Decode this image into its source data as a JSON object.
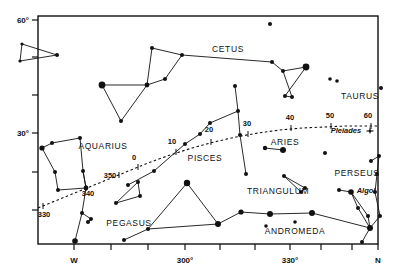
{
  "chart_data": {
    "type": "scatter",
    "title": "",
    "subtitle": "",
    "xlabel": "",
    "ylabel": "",
    "grid": false,
    "legend": null,
    "xlim": [
      262,
      372
    ],
    "ylim": [
      18,
      62
    ],
    "frame": {
      "left": 38,
      "right": 378,
      "top": 16,
      "bottom": 244
    },
    "x_axis": {
      "name": "azimuth",
      "ticks": [
        {
          "value": 270,
          "label": "W",
          "px": 74
        },
        {
          "value": 280,
          "label": "",
          "px": 111
        },
        {
          "value": 290,
          "label": "",
          "px": 148
        },
        {
          "value": 300,
          "label": "300°",
          "px": 185
        },
        {
          "value": 310,
          "label": "",
          "px": 220
        },
        {
          "value": 320,
          "label": "",
          "px": 255
        },
        {
          "value": 330,
          "label": "330°",
          "px": 290
        },
        {
          "value": 340,
          "label": "",
          "px": 321
        },
        {
          "value": 350,
          "label": "",
          "px": 352
        },
        {
          "value": 360,
          "label": "N",
          "px": 378
        }
      ]
    },
    "y_axis": {
      "name": "altitude",
      "ticks": [
        {
          "value": 60,
          "label": "60°",
          "px": 20
        },
        {
          "value": 50,
          "label": "",
          "px": 57
        },
        {
          "value": 40,
          "label": "",
          "px": 95
        },
        {
          "value": 30,
          "label": "30°",
          "px": 133
        },
        {
          "value": 20,
          "label": "",
          "px": 172
        },
        {
          "value": 10,
          "label": "",
          "px": 210
        }
      ]
    },
    "ecliptic": {
      "style": "dashed",
      "path": "M 38,208 L 60,199 L 82,190 L 104,181 L 126,172 L 148,163 L 170,155 L 192,148 L 214,142 L 236,137 L 258,133 L 280,130 L 302,128 L 324,127 L 346,126 L 368,126 L 378,126",
      "markers": [
        {
          "label": "330",
          "x": 43,
          "y": 206,
          "tx": 44,
          "ty": 217
        },
        {
          "label": "340",
          "x": 86,
          "y": 188,
          "tx": 88,
          "ty": 196
        },
        {
          "label": "350",
          "x": 119,
          "y": 175,
          "tx": 110,
          "ty": 178
        },
        {
          "label": "0",
          "x": 138,
          "y": 167,
          "tx": 134,
          "ty": 160
        },
        {
          "label": "10",
          "x": 176,
          "y": 152,
          "tx": 172,
          "ty": 144
        },
        {
          "label": "20",
          "x": 211,
          "y": 142,
          "tx": 209,
          "ty": 132
        },
        {
          "label": "30",
          "x": 248,
          "y": 134,
          "tx": 247,
          "ty": 126
        },
        {
          "label": "40",
          "x": 291,
          "y": 128,
          "tx": 290,
          "ty": 120
        },
        {
          "label": "50",
          "x": 331,
          "y": 126,
          "tx": 330,
          "ty": 118
        },
        {
          "label": "60",
          "x": 371,
          "y": 126,
          "tx": 368,
          "ty": 118
        }
      ]
    },
    "constellation_labels": [
      {
        "name": "CETUS",
        "x": 228,
        "y": 52
      },
      {
        "name": "TAURUS",
        "x": 360,
        "y": 99
      },
      {
        "name": "AQUARIUS",
        "x": 103,
        "y": 149
      },
      {
        "name": "PISCES",
        "x": 205,
        "y": 161
      },
      {
        "name": "ARIES",
        "x": 285,
        "y": 145
      },
      {
        "name": "PERSEUS",
        "x": 357,
        "y": 176
      },
      {
        "name": "TRIANGULUM",
        "x": 278,
        "y": 194
      },
      {
        "name": "PEGASUS",
        "x": 129,
        "y": 226
      },
      {
        "name": "ANDROMEDA",
        "x": 295,
        "y": 234
      }
    ],
    "italic_labels": [
      {
        "name": "Pleiades",
        "x": 346,
        "y": 133
      },
      {
        "name": "Algol",
        "x": 366,
        "y": 193
      }
    ],
    "special_markers": [
      {
        "name": "pleiades-cluster-symbol",
        "x": 370,
        "y": 131
      }
    ],
    "stars": [
      {
        "x": 22,
        "y": 44,
        "mag": 1.6
      },
      {
        "x": 20,
        "y": 61,
        "mag": 1.6
      },
      {
        "x": 57,
        "y": 55,
        "mag": 2.0
      },
      {
        "x": 270,
        "y": 24,
        "mag": 2.0
      },
      {
        "x": 152,
        "y": 48,
        "mag": 2.0
      },
      {
        "x": 182,
        "y": 55,
        "mag": 2.0
      },
      {
        "x": 272,
        "y": 62,
        "mag": 2.0
      },
      {
        "x": 283,
        "y": 71,
        "mag": 2.0
      },
      {
        "x": 306,
        "y": 67,
        "mag": 3.4
      },
      {
        "x": 285,
        "y": 96,
        "mag": 2.0
      },
      {
        "x": 292,
        "y": 97,
        "mag": 2.0
      },
      {
        "x": 102,
        "y": 85,
        "mag": 3.4
      },
      {
        "x": 147,
        "y": 85,
        "mag": 2.4
      },
      {
        "x": 165,
        "y": 79,
        "mag": 2.0
      },
      {
        "x": 121,
        "y": 121,
        "mag": 2.0
      },
      {
        "x": 330,
        "y": 79,
        "mag": 1.8
      },
      {
        "x": 337,
        "y": 81,
        "mag": 1.8
      },
      {
        "x": 381,
        "y": 88,
        "mag": 2.0
      },
      {
        "x": 235,
        "y": 86,
        "mag": 2.0
      },
      {
        "x": 238,
        "y": 111,
        "mag": 2.0
      },
      {
        "x": 240,
        "y": 135,
        "mag": 2.0
      },
      {
        "x": 246,
        "y": 174,
        "mag": 2.0
      },
      {
        "x": 200,
        "y": 134,
        "mag": 2.0
      },
      {
        "x": 210,
        "y": 123,
        "mag": 2.0
      },
      {
        "x": 185,
        "y": 144,
        "mag": 2.0
      },
      {
        "x": 154,
        "y": 171,
        "mag": 2.0
      },
      {
        "x": 128,
        "y": 185,
        "mag": 2.0
      },
      {
        "x": 42,
        "y": 148,
        "mag": 2.6
      },
      {
        "x": 52,
        "y": 143,
        "mag": 2.0
      },
      {
        "x": 80,
        "y": 138,
        "mag": 2.0
      },
      {
        "x": 55,
        "y": 172,
        "mag": 2.0
      },
      {
        "x": 83,
        "y": 171,
        "mag": 2.0
      },
      {
        "x": 58,
        "y": 190,
        "mag": 2.0
      },
      {
        "x": 86,
        "y": 188,
        "mag": 2.4
      },
      {
        "x": 82,
        "y": 213,
        "mag": 2.0
      },
      {
        "x": 91,
        "y": 219,
        "mag": 2.0
      },
      {
        "x": 88,
        "y": 222,
        "mag": 2.0
      },
      {
        "x": 75,
        "y": 241,
        "mag": 2.8
      },
      {
        "x": 124,
        "y": 240,
        "mag": 2.0
      },
      {
        "x": 148,
        "y": 229,
        "mag": 2.0
      },
      {
        "x": 116,
        "y": 203,
        "mag": 2.0
      },
      {
        "x": 140,
        "y": 196,
        "mag": 2.0
      },
      {
        "x": 138,
        "y": 182,
        "mag": 2.0
      },
      {
        "x": 187,
        "y": 183,
        "mag": 3.2
      },
      {
        "x": 218,
        "y": 224,
        "mag": 3.0
      },
      {
        "x": 241,
        "y": 212,
        "mag": 2.6
      },
      {
        "x": 270,
        "y": 214,
        "mag": 3.0
      },
      {
        "x": 312,
        "y": 213,
        "mag": 3.0
      },
      {
        "x": 295,
        "y": 222,
        "mag": 1.8
      },
      {
        "x": 266,
        "y": 226,
        "mag": 1.8
      },
      {
        "x": 265,
        "y": 148,
        "mag": 2.2
      },
      {
        "x": 283,
        "y": 150,
        "mag": 3.0
      },
      {
        "x": 325,
        "y": 153,
        "mag": 2.0
      },
      {
        "x": 284,
        "y": 176,
        "mag": 2.0
      },
      {
        "x": 305,
        "y": 188,
        "mag": 2.0
      },
      {
        "x": 301,
        "y": 192,
        "mag": 2.0
      },
      {
        "x": 339,
        "y": 190,
        "mag": 2.0
      },
      {
        "x": 351,
        "y": 192,
        "mag": 2.8
      },
      {
        "x": 371,
        "y": 161,
        "mag": 2.0
      },
      {
        "x": 379,
        "y": 156,
        "mag": 2.0
      },
      {
        "x": 377,
        "y": 174,
        "mag": 2.0
      },
      {
        "x": 375,
        "y": 192,
        "mag": 2.0
      },
      {
        "x": 358,
        "y": 208,
        "mag": 2.0
      },
      {
        "x": 368,
        "y": 216,
        "mag": 2.0
      },
      {
        "x": 370,
        "y": 228,
        "mag": 3.0
      },
      {
        "x": 362,
        "y": 242,
        "mag": 2.0
      },
      {
        "x": 380,
        "y": 216,
        "mag": 2.0
      }
    ],
    "constellation_lines": [
      "M 22,44 L 57,55 L 20,61 L 22,44",
      "M 102,85 L 147,85 L 121,121 L 102,85",
      "M 147,85 L 152,48 L 182,55 L 165,79 L 147,85",
      "M 182,55 L 272,62 L 283,71 L 306,67 L 285,96 L 292,97 L 283,71",
      "M 42,148 L 52,143 L 80,138 L 83,171 L 86,188 L 58,190 L 55,172 L 42,148",
      "M 83,171 L 86,188",
      "M 86,188 L 82,213 L 75,241",
      "M 82,213 L 91,219 L 88,222",
      "M 235,86 L 238,111 L 240,135 L 246,174",
      "M 238,111 L 210,123 L 200,134 L 185,144 L 154,171 L 128,185",
      "M 138,182 L 140,196 L 116,203 L 138,182",
      "M 124,240 L 148,229 L 187,183 L 218,224 L 148,229",
      "M 218,224 L 241,212 L 270,214 L 312,213 L 370,228",
      "M 265,148 L 283,150",
      "M 284,176 L 305,188 L 301,192 L 284,176",
      "M 339,190 L 351,192",
      "M 351,192 L 358,208 L 370,228 L 380,216 L 375,192 L 377,174 L 379,156 L 371,161",
      "M 370,228 L 362,242",
      "M 370,228 L 368,216 L 351,192"
    ]
  }
}
